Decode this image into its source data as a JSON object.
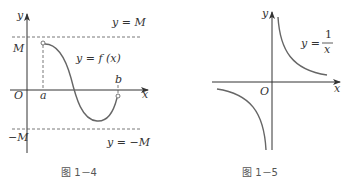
{
  "figures": [
    {
      "id": "fig-1-4",
      "caption": "图 1－4",
      "labels": {
        "y_axis": "y",
        "x_axis": "x",
        "origin": "O",
        "M": "M",
        "neg_M": "−M",
        "a": "a",
        "b": "b",
        "line_top": "y = M",
        "line_bottom": "y = −M",
        "function": "y = f (x)"
      }
    },
    {
      "id": "fig-1-5",
      "caption": "图 1－5",
      "labels": {
        "y_axis": "y",
        "x_axis": "x",
        "origin": "O",
        "function_prefix": "y =",
        "numerator": "1",
        "denominator": "x"
      }
    }
  ],
  "colors": {
    "axis": "#333333",
    "curve": "#666666",
    "text": "#333333"
  }
}
